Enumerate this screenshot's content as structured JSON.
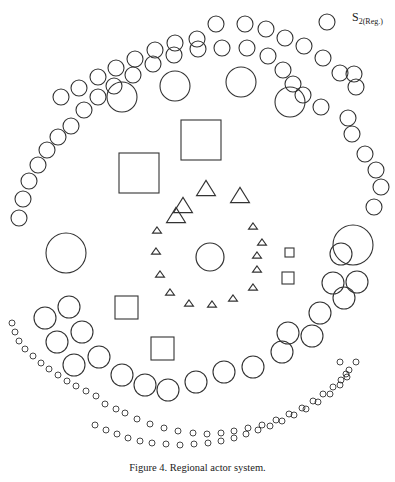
{
  "figure": {
    "label_main": "S",
    "label_sub": "2(Reg.)",
    "caption": "Figure 4.  Regional actor system."
  },
  "colors": {
    "stroke": "#333333",
    "background": "#ffffff"
  },
  "shapes": {
    "outer_ring_top_circles": [
      [
        19,
        218,
        8
      ],
      [
        23,
        199,
        8
      ],
      [
        29,
        181,
        8
      ],
      [
        38,
        165,
        8
      ],
      [
        47,
        150,
        8
      ],
      [
        58,
        137,
        8
      ],
      [
        71,
        126,
        8
      ],
      [
        84,
        110,
        8
      ],
      [
        98,
        97,
        8
      ],
      [
        114,
        86,
        8
      ],
      [
        133,
        75,
        8
      ],
      [
        153,
        64,
        8
      ],
      [
        174,
        55,
        8
      ],
      [
        198,
        49,
        8
      ],
      [
        222,
        48,
        8
      ],
      [
        247,
        48,
        8
      ],
      [
        268,
        56,
        8
      ],
      [
        283,
        70,
        8
      ],
      [
        293,
        84,
        8
      ],
      [
        303,
        95,
        8
      ],
      [
        321,
        107,
        8
      ],
      [
        348,
        118,
        8
      ],
      [
        352,
        134,
        8
      ],
      [
        365,
        154,
        8
      ],
      [
        376,
        170,
        8
      ],
      [
        381,
        187,
        8
      ],
      [
        374,
        207,
        8
      ]
    ],
    "inner_ring_top_circles": [
      [
        61,
        97,
        8
      ],
      [
        79,
        88,
        8
      ],
      [
        98,
        77,
        8
      ],
      [
        116,
        68,
        8
      ],
      [
        135,
        59,
        8
      ],
      [
        155,
        50,
        8
      ],
      [
        175,
        43,
        8
      ],
      [
        197,
        39,
        8
      ],
      [
        216,
        24,
        8
      ],
      [
        245,
        24,
        8
      ],
      [
        266,
        29,
        8
      ],
      [
        285,
        38,
        8
      ],
      [
        304,
        46,
        8
      ],
      [
        323,
        58,
        8
      ],
      [
        340,
        73,
        8
      ],
      [
        356,
        87,
        8
      ],
      [
        327,
        22,
        8
      ],
      [
        354,
        74,
        8
      ]
    ],
    "large_circles": [
      [
        122,
        97,
        15
      ],
      [
        175,
        86,
        15
      ],
      [
        241,
        82,
        15
      ],
      [
        290,
        102,
        15
      ],
      [
        66,
        253,
        20
      ],
      [
        353,
        245,
        20
      ]
    ],
    "mid_ring_circles": [
      [
        45,
        318,
        11
      ],
      [
        69,
        307,
        11
      ],
      [
        57,
        342,
        11
      ],
      [
        82,
        332,
        11
      ],
      [
        74,
        365,
        11
      ],
      [
        99,
        357,
        11
      ],
      [
        122,
        375,
        11
      ],
      [
        145,
        385,
        11
      ],
      [
        168,
        390,
        11
      ],
      [
        196,
        382,
        11
      ],
      [
        224,
        372,
        11
      ],
      [
        253,
        367,
        11
      ],
      [
        282,
        352,
        11
      ],
      [
        312,
        336,
        11
      ],
      [
        320,
        313,
        11
      ],
      [
        344,
        298,
        11
      ],
      [
        333,
        283,
        11
      ],
      [
        357,
        282,
        11
      ],
      [
        341,
        254,
        11
      ],
      [
        288,
        333,
        11
      ]
    ],
    "bottom_row_circles": [
      [
        12,
        323,
        3
      ],
      [
        15,
        332,
        3
      ],
      [
        19,
        341,
        3
      ],
      [
        25,
        349,
        3
      ],
      [
        33,
        356,
        3
      ],
      [
        41,
        363,
        3
      ],
      [
        49,
        369,
        3
      ],
      [
        58,
        375,
        3
      ],
      [
        67,
        381,
        3
      ],
      [
        76,
        386,
        3
      ],
      [
        86,
        391,
        3
      ],
      [
        96,
        396,
        3
      ],
      [
        105,
        404,
        3
      ],
      [
        116,
        409,
        3
      ],
      [
        125,
        413,
        3
      ],
      [
        137,
        419,
        3
      ],
      [
        150,
        424,
        3
      ],
      [
        164,
        428,
        3
      ],
      [
        178,
        431,
        3
      ],
      [
        193,
        433,
        3
      ],
      [
        207,
        434,
        3
      ],
      [
        221,
        433,
        3
      ],
      [
        234,
        431,
        3
      ],
      [
        248,
        428,
        3
      ],
      [
        262,
        425,
        3
      ],
      [
        276,
        420,
        3
      ],
      [
        289,
        414,
        3
      ],
      [
        302,
        408,
        3
      ],
      [
        313,
        401,
        3
      ],
      [
        323,
        394,
        3
      ],
      [
        333,
        387,
        3
      ],
      [
        341,
        380,
        3
      ],
      [
        349,
        370,
        3
      ],
      [
        356,
        362,
        3
      ]
    ],
    "bottom_row2_circles": [
      [
        95,
        425,
        3
      ],
      [
        106,
        430,
        3
      ],
      [
        117,
        434,
        3
      ],
      [
        128,
        438,
        3
      ],
      [
        140,
        441,
        3
      ],
      [
        152,
        443,
        3
      ],
      [
        166,
        444,
        3
      ],
      [
        180,
        445,
        3
      ],
      [
        194,
        444,
        3
      ],
      [
        208,
        443,
        3
      ],
      [
        221,
        441,
        3
      ],
      [
        234,
        438,
        3
      ],
      [
        246,
        434,
        3
      ],
      [
        258,
        430,
        3
      ],
      [
        270,
        426,
        3
      ],
      [
        282,
        421,
        3
      ],
      [
        294,
        415,
        3
      ],
      [
        306,
        409,
        3
      ],
      [
        318,
        402,
        3
      ],
      [
        330,
        394,
        3
      ],
      [
        340,
        385,
        3
      ],
      [
        347,
        377,
        3
      ],
      [
        340,
        362,
        3
      ],
      [
        346,
        374,
        3
      ]
    ],
    "large_squares": [
      [
        119,
        153,
        40,
        40
      ],
      [
        181,
        120,
        40,
        40
      ],
      [
        115,
        296,
        23,
        23
      ],
      [
        151,
        337,
        23,
        23
      ]
    ],
    "small_squares": [
      [
        285,
        248,
        9,
        9
      ],
      [
        282,
        272,
        12,
        12
      ]
    ],
    "large_triangles": [
      [
        183,
        205,
        17
      ],
      [
        206,
        188,
        17
      ],
      [
        240,
        195,
        17
      ],
      [
        176,
        215,
        17
      ]
    ],
    "small_triangles": [
      [
        157,
        230,
        7
      ],
      [
        156,
        251,
        7
      ],
      [
        160,
        274,
        7
      ],
      [
        170,
        292,
        7
      ],
      [
        189,
        303,
        7
      ],
      [
        212,
        304,
        7
      ],
      [
        233,
        298,
        7
      ],
      [
        253,
        287,
        7
      ],
      [
        257,
        269,
        7
      ],
      [
        257,
        255,
        7
      ],
      [
        262,
        242,
        7
      ],
      [
        253,
        226,
        7
      ]
    ],
    "hatched_circle": {
      "cx": 210,
      "cy": 257,
      "r": 14
    }
  }
}
